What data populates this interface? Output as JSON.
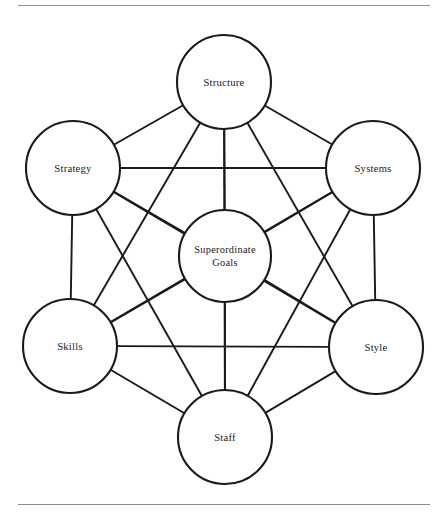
{
  "figure": {
    "name": "7s-framework-diagram",
    "type": "diagram",
    "layout": "hexagonal-network",
    "background_color": "#ffffff",
    "line_color": "#1a1a1a",
    "rule_color": "#8e8e8e"
  },
  "rules": {
    "top_label": "top-divider",
    "bottom_label": "bottom-divider"
  },
  "nodes": [
    {
      "id": "structure",
      "label": "Structure",
      "cx": 224,
      "cy": 82,
      "r": 47,
      "lines": [
        "Structure"
      ]
    },
    {
      "id": "strategy",
      "label": "Strategy",
      "cx": 73,
      "cy": 168,
      "r": 47,
      "lines": [
        "Strategy"
      ]
    },
    {
      "id": "systems",
      "label": "Systems",
      "cx": 373,
      "cy": 168,
      "r": 47,
      "lines": [
        "Systems"
      ]
    },
    {
      "id": "superordinate-goals",
      "label": "Superordinate Goals",
      "cx": 225,
      "cy": 256,
      "r": 46,
      "lines": [
        "Superordinate",
        "Goals"
      ]
    },
    {
      "id": "skills",
      "label": "Skills",
      "cx": 70,
      "cy": 346,
      "r": 47,
      "lines": [
        "Skills"
      ]
    },
    {
      "id": "style",
      "label": "Style",
      "cx": 376,
      "cy": 347,
      "r": 47,
      "lines": [
        "Style"
      ]
    },
    {
      "id": "staff",
      "label": "Staff",
      "cx": 225,
      "cy": 437,
      "r": 47,
      "lines": [
        "Staff"
      ]
    }
  ],
  "edges": [
    [
      "structure",
      "strategy"
    ],
    [
      "structure",
      "systems"
    ],
    [
      "structure",
      "superordinate-goals"
    ],
    [
      "structure",
      "skills"
    ],
    [
      "structure",
      "style"
    ],
    [
      "structure",
      "staff"
    ],
    [
      "strategy",
      "systems"
    ],
    [
      "strategy",
      "superordinate-goals"
    ],
    [
      "strategy",
      "skills"
    ],
    [
      "strategy",
      "style"
    ],
    [
      "strategy",
      "staff"
    ],
    [
      "systems",
      "superordinate-goals"
    ],
    [
      "systems",
      "skills"
    ],
    [
      "systems",
      "style"
    ],
    [
      "systems",
      "staff"
    ],
    [
      "superordinate-goals",
      "skills"
    ],
    [
      "superordinate-goals",
      "style"
    ],
    [
      "superordinate-goals",
      "staff"
    ],
    [
      "skills",
      "style"
    ],
    [
      "skills",
      "staff"
    ],
    [
      "style",
      "staff"
    ]
  ],
  "labels": {
    "structure": "Structure",
    "strategy": "Strategy",
    "systems": "Systems",
    "superordinate_goals_line1": "Superordinate",
    "superordinate_goals_line2": "Goals",
    "skills": "Skills",
    "style": "Style",
    "staff": "Staff"
  }
}
